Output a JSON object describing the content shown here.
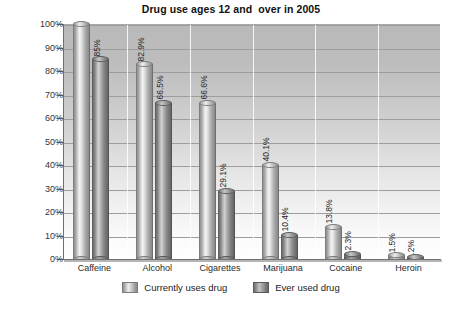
{
  "chart_data": {
    "type": "bar",
    "title": "Drug use ages 12 and  over in 2005",
    "xlabel": "",
    "ylabel": "",
    "ylim": [
      0,
      100
    ],
    "grid": true,
    "legend_position": "bottom",
    "categories": [
      "Caffeine",
      "Alcohol",
      "Cigarettes",
      "Marijuana",
      "Cocaine",
      "Heroin"
    ],
    "ytick_labels": [
      "0%",
      "10%",
      "20%",
      "30%",
      "40%",
      "50%",
      "60%",
      "70%",
      "80%",
      "90%",
      "100%"
    ],
    "ytick_values": [
      0,
      10,
      20,
      30,
      40,
      50,
      60,
      70,
      80,
      90,
      100
    ],
    "series": [
      {
        "name": "Currently uses drug",
        "style": "light",
        "values": [
          100,
          82.9,
          66.6,
          40.1,
          13.8,
          1.5
        ],
        "labels": [
          "",
          "82.9%",
          "66.6%",
          "40.1%",
          "13.8%",
          "1.5%"
        ]
      },
      {
        "name": "Ever used drug",
        "style": "dark",
        "values": [
          85,
          66.5,
          29.1,
          10.4,
          2.3,
          0.2
        ],
        "labels": [
          "85%",
          "66.5%",
          "29.1%",
          "10.4%",
          "2.3%",
          ".2%"
        ]
      }
    ]
  },
  "colors": {
    "plot_background_top": "#b9b9b9",
    "plot_background_bottom": "#ffffff",
    "gridline": "#9d9d9d",
    "axis": "#6f6f6f",
    "bar_light": "#d8d8d8",
    "bar_dark": "#8c8c8c",
    "text": "#222222",
    "page_background": "#ffffff"
  }
}
